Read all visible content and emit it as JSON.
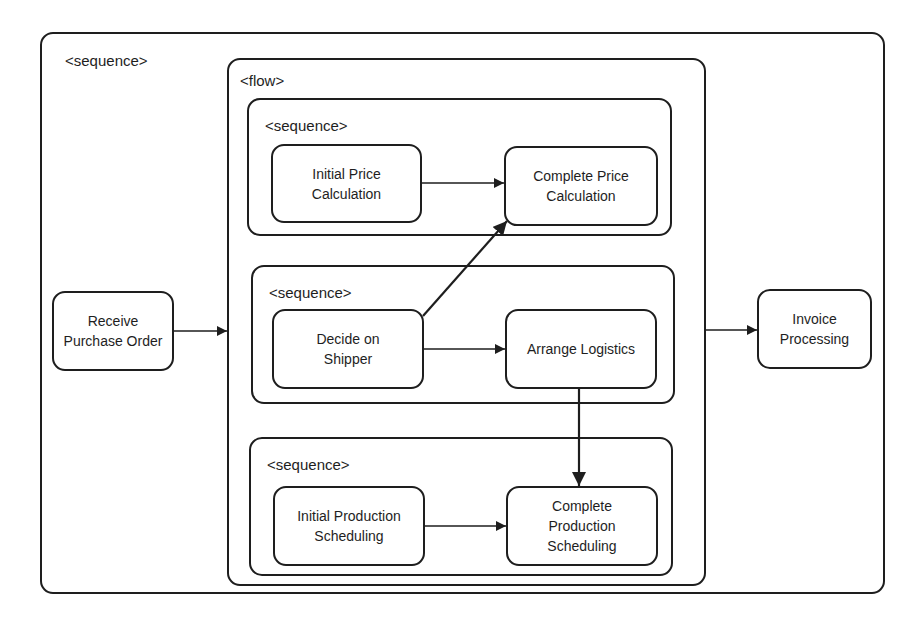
{
  "diagram": {
    "type": "BPEL process structure",
    "containers": {
      "outer": {
        "label": "<sequence>"
      },
      "flow": {
        "label": "<flow>"
      },
      "seq1": {
        "label": "<sequence>"
      },
      "seq2": {
        "label": "<sequence>"
      },
      "seq3": {
        "label": "<sequence>"
      }
    },
    "nodes": {
      "receive_po": {
        "label": "Receive Purchase Order"
      },
      "initial_price": {
        "label": "Initial Price Calculation"
      },
      "complete_price": {
        "label": "Complete Price Calculation"
      },
      "decide_shipper": {
        "label": "Decide on Shipper"
      },
      "arrange_logistics": {
        "label": "Arrange Logistics"
      },
      "initial_production": {
        "label": "Initial Production Scheduling"
      },
      "complete_production": {
        "label": "Complete Production Scheduling"
      },
      "invoice": {
        "label": "Invoice Processing"
      }
    },
    "edges": [
      {
        "from": "Receive Purchase Order",
        "to": "<flow>"
      },
      {
        "from": "Initial Price Calculation",
        "to": "Complete Price Calculation"
      },
      {
        "from": "Decide on Shipper",
        "to": "Complete Price Calculation",
        "style": "bold"
      },
      {
        "from": "Decide on Shipper",
        "to": "Arrange Logistics"
      },
      {
        "from": "Arrange Logistics",
        "to": "Complete Production Scheduling",
        "style": "bold"
      },
      {
        "from": "Initial Production Scheduling",
        "to": "Complete Production Scheduling"
      },
      {
        "from": "<flow>",
        "to": "Invoice Processing"
      }
    ],
    "colors": {
      "stroke": "#1e1e1e",
      "background": "#ffffff"
    }
  }
}
